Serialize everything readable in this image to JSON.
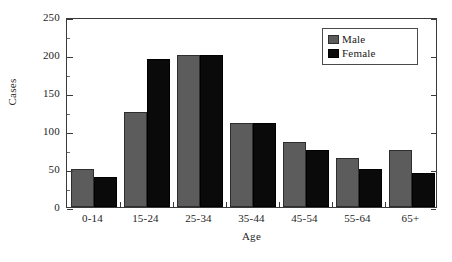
{
  "chart_data": {
    "type": "bar",
    "title": "",
    "xlabel": "Age",
    "ylabel": "Cases",
    "categories": [
      "0-14",
      "15-24",
      "25-34",
      "35-44",
      "45-54",
      "55-64",
      "65+"
    ],
    "series": [
      {
        "name": "Male",
        "color": "#5c5c5c",
        "values": [
          50,
          125,
          200,
          110,
          85,
          65,
          75
        ]
      },
      {
        "name": "Female",
        "color": "#0a0a0a",
        "values": [
          40,
          195,
          200,
          110,
          75,
          50,
          45
        ]
      }
    ],
    "ylim": [
      0,
      250
    ],
    "ytick_values": [
      0,
      50,
      100,
      150,
      200,
      250
    ],
    "ytick_labels": [
      "0",
      "50",
      "100",
      "150",
      "200",
      "250"
    ],
    "yminor_step": 25,
    "grid": false,
    "legend_position": "top-right",
    "legend_entries": [
      "Male",
      "Female"
    ]
  },
  "axes": {
    "y_title": "Cases",
    "x_title": "Age"
  }
}
